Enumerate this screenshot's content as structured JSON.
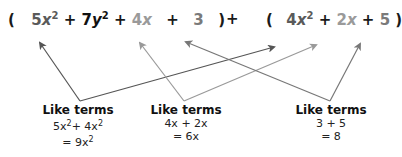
{
  "expression": {
    "left_open": "(",
    "left_terms": [
      {
        "coef": "5",
        "var": "x",
        "exp": "2",
        "color": "#5a5a5a"
      },
      {
        "op": "+"
      },
      {
        "coef": "7",
        "var": "y",
        "exp": "2",
        "color": "#111111"
      },
      {
        "op": "+"
      },
      {
        "coef": "4",
        "var": "x",
        "exp": "",
        "color": "#9a9a9a"
      },
      {
        "op": "+"
      },
      {
        "coef": "3",
        "var": "",
        "exp": "",
        "color": "#7a7a7a"
      }
    ],
    "left_close": ")",
    "middle_op": "+",
    "right_open": "(",
    "right_terms": [
      {
        "coef": "4",
        "var": "x",
        "exp": "2",
        "color": "#5a5a5a"
      },
      {
        "op": "+"
      },
      {
        "coef": "2",
        "var": "x",
        "exp": "",
        "color": "#9a9a9a"
      },
      {
        "op": "+"
      },
      {
        "coef": "5",
        "var": "",
        "exp": "",
        "color": "#7a7a7a"
      }
    ],
    "right_close": ")"
  },
  "groups": [
    {
      "title": "Like terms",
      "line1_a": "5x",
      "line1_a_exp": "2",
      "line1_op": "+ 4x",
      "line1_b_exp": "2",
      "line2": "= 9x",
      "line2_exp": "2"
    },
    {
      "title": "Like terms",
      "line1": "4x + 2x",
      "line2": "= 6x"
    },
    {
      "title": "Like terms",
      "line1": "3 + 5",
      "line2": "= 8"
    }
  ],
  "arrow_colors": {
    "x2": "#555555",
    "x": "#999999",
    "const": "#777777"
  }
}
